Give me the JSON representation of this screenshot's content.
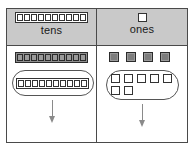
{
  "diagram": {
    "columns": [
      {
        "key": "tens",
        "label": "tens",
        "header_icon": "ten-rod-icon",
        "header_rod_segments": 10,
        "loose_blocks": {
          "icon": "ten-rod-gray-icon",
          "type": "rod",
          "segments": 10,
          "count": 1,
          "fill": "#9a9a9a"
        },
        "grouped": {
          "icon": "oval-group-icon",
          "type": "rod",
          "segments": 10,
          "count": 1,
          "fill": "#ffffff"
        },
        "arrow": "down-arrow-icon"
      },
      {
        "key": "ones",
        "label": "ones",
        "header_icon": "unit-cube-icon",
        "header_cube_count": 1,
        "loose_blocks": {
          "icon": "unit-cube-gray-icon",
          "type": "cube",
          "count": 4,
          "fill": "#9a9a9a"
        },
        "grouped": {
          "icon": "oval-group-icon",
          "type": "cube",
          "count": 7,
          "row_top": 5,
          "row_bottom": 2,
          "fill": "#ffffff"
        },
        "arrow": "down-arrow-icon"
      }
    ],
    "colors": {
      "header_fill": "#c9c9c9",
      "border": "#4a4a4a",
      "block_gray": "#9a9a9a",
      "block_white": "#ffffff",
      "arrow": "#8a8a8a",
      "oval_stroke": "#555555"
    }
  }
}
